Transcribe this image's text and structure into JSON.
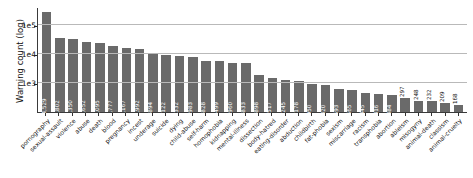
{
  "chart_data": {
    "type": "bar",
    "title": "",
    "xlabel": "",
    "ylabel": "Warning count (log)",
    "yscale": "log",
    "ylim": [
      100,
      400000
    ],
    "yticklabels": [
      "1e3",
      "1e4",
      "1e5"
    ],
    "ytickvalues": [
      1000,
      10000,
      100000
    ],
    "grid": true,
    "legend": "none",
    "bar_color": "#6a6a6a",
    "categories": [
      "pornography",
      "sexual-assault",
      "violence",
      "abuse",
      "death",
      "blood",
      "pregnancy",
      "incest",
      "underage",
      "suicide",
      "dying",
      "child-abuse",
      "self-harm",
      "homophobia",
      "kidnapping",
      "mental-illness",
      "dissection",
      "body-hatred",
      "eating-disorder",
      "abduction",
      "childbirth",
      "fat-phobia",
      "sexism",
      "miscarriage",
      "racism",
      "transphobia",
      "abortion",
      "ableism",
      "misogyny",
      "animal-death",
      "classism",
      "animal-cruelty"
    ],
    "values": [
      264529,
      34802,
      32350,
      24652,
      23095,
      18777,
      15167,
      14992,
      9894,
      9122,
      8332,
      7983,
      5828,
      5499,
      4960,
      4833,
      1898,
      1517,
      1245,
      1178,
      950,
      820,
      593,
      565,
      445,
      416,
      384,
      297,
      248,
      232,
      209,
      168
    ],
    "value_labels": [
      "264,529",
      "34,802",
      "32,350",
      "24,652",
      "23,095",
      "18,777",
      "15,167",
      "14,992",
      "9,894",
      "9,122",
      "8,332",
      "7,983",
      "5,828",
      "5,499",
      "4,960",
      "4,833",
      "1,898",
      "1,517",
      "1,245",
      "1,178",
      "950",
      "820",
      "593",
      "565",
      "445",
      "416",
      "384",
      "297",
      "248",
      "232",
      "209",
      "168"
    ]
  }
}
